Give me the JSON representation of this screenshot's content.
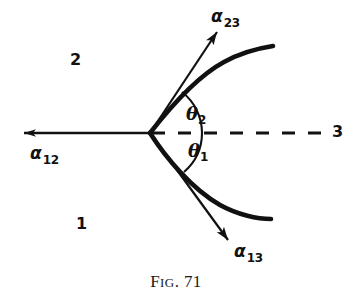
{
  "figure": {
    "caption_prefix": "F",
    "caption_small": "IG",
    "caption_suffix": ". 71",
    "caption_full": "FIG. 71",
    "background_color": "#ffffff",
    "ink_color": "#111111"
  },
  "labels": {
    "alpha_23": {
      "symbol": "α",
      "subscript": "23",
      "x": 211,
      "y": 8
    },
    "alpha_12": {
      "symbol": "α",
      "subscript": "12",
      "x": 30,
      "y": 145
    },
    "alpha_13": {
      "symbol": "α",
      "subscript": "13",
      "x": 234,
      "y": 243
    },
    "theta_2": {
      "symbol": "θ",
      "subscript": "2",
      "x": 186,
      "y": 106
    },
    "theta_1": {
      "symbol": "θ",
      "subscript": "1",
      "x": 188,
      "y": 143
    },
    "region_2": {
      "text": "2",
      "x": 70,
      "y": 52
    },
    "region_1": {
      "text": "1",
      "x": 76,
      "y": 216
    },
    "region_3": {
      "text": "3",
      "x": 332,
      "y": 124
    }
  },
  "geometry": {
    "junction": {
      "x": 150,
      "y": 133
    },
    "dashed_line": {
      "x1": 150,
      "y1": 133,
      "x2": 320,
      "y2": 133,
      "dash": "12 12",
      "width": 3
    },
    "alpha12_arrow": {
      "x1": 150,
      "y1": 133,
      "x2": 22,
      "y2": 133,
      "width": 2
    },
    "alpha23_arrow": {
      "x1": 150,
      "y1": 133,
      "x2": 218,
      "y2": 31,
      "width": 2
    },
    "alpha13_arrow": {
      "x1": 150,
      "y1": 133,
      "x2": 229,
      "y2": 241,
      "width": 2
    },
    "upper_interface": {
      "start_x": 150,
      "start_y": 133,
      "end_x": 273,
      "end_y": 46,
      "width": 4.5
    },
    "lower_interface": {
      "start_x": 150,
      "start_y": 133,
      "end_x": 271,
      "end_y": 219,
      "width": 4.5
    },
    "theta2_arc_radius": 52,
    "theta1_arc_radius": 52
  }
}
